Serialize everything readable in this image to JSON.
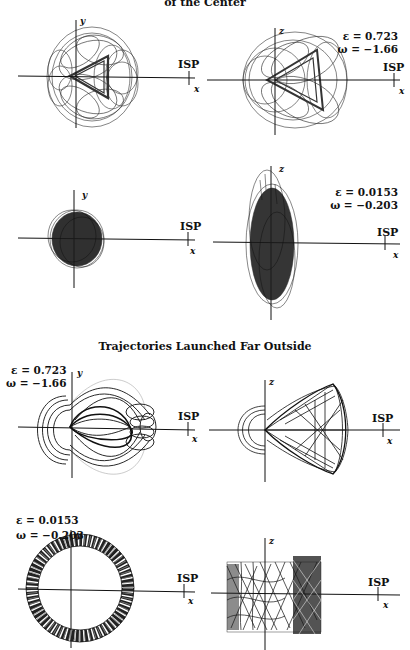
{
  "titles": {
    "top": "of the Center",
    "middle": "Trajectories Launched Far Outside"
  },
  "panels": [
    {
      "id": "p1",
      "plane": "xy",
      "vlabel": "y",
      "hlabel": "x",
      "isp": "ISP",
      "eps": "",
      "omega": ""
    },
    {
      "id": "p2",
      "plane": "xz",
      "vlabel": "z",
      "hlabel": "x",
      "isp": "ISP",
      "eps": "ε = 0.723",
      "omega": "ω = −1.66"
    },
    {
      "id": "p3",
      "plane": "xy",
      "vlabel": "y",
      "hlabel": "x",
      "isp": "ISP",
      "eps": "",
      "omega": ""
    },
    {
      "id": "p4",
      "plane": "xz",
      "vlabel": "z",
      "hlabel": "x",
      "isp": "ISP",
      "eps": "ε = 0.0153",
      "omega": "ω = −0.203"
    },
    {
      "id": "p5",
      "plane": "xy",
      "vlabel": "y",
      "hlabel": "x",
      "isp": "ISP",
      "eps": "ε = 0.723",
      "omega": "ω = −1.66"
    },
    {
      "id": "p6",
      "plane": "xz",
      "vlabel": "z",
      "hlabel": "x",
      "isp": "ISP",
      "eps": "",
      "omega": ""
    },
    {
      "id": "p7",
      "plane": "xy",
      "vlabel": "y",
      "hlabel": "x",
      "isp": "ISP",
      "eps": "ε = 0.0153",
      "omega": "ω = −0.203"
    },
    {
      "id": "p8",
      "plane": "xz",
      "vlabel": "z",
      "hlabel": "x",
      "isp": "ISP",
      "eps": "",
      "omega": ""
    }
  ],
  "groups": [
    {
      "label": "Trajectories Launched in the Center (title partially cut off)",
      "panels": [
        "p1",
        "p2",
        "p3",
        "p4"
      ]
    },
    {
      "label": "Trajectories Launched Far Outside",
      "panels": [
        "p5",
        "p6",
        "p7",
        "p8"
      ]
    }
  ],
  "colors": {
    "ink": "#111111",
    "background": "#ffffff"
  }
}
